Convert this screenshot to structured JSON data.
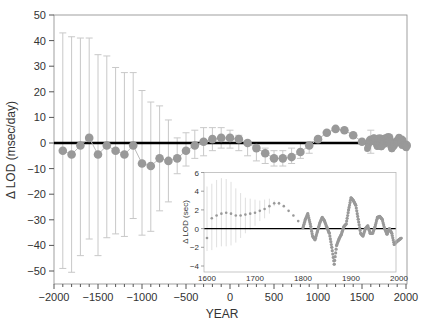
{
  "chart_data": [
    {
      "type": "scatter",
      "title": "",
      "xlabel": "YEAR",
      "ylabel": "Δ LOD (msec/day)",
      "xlim": [
        -2000,
        2000
      ],
      "ylim": [
        -55,
        50
      ],
      "xticks": [
        -2000,
        -1500,
        -1000,
        -500,
        0,
        500,
        1000,
        1500,
        2000
      ],
      "xtick_labels": [
        "−2000",
        "−1500",
        "−1000",
        "−500",
        "0",
        "500",
        "1000",
        "1500",
        "2000"
      ],
      "yticks": [
        50,
        40,
        30,
        20,
        10,
        0,
        -10,
        -20,
        -30,
        -40,
        -50
      ],
      "ytick_labels": [
        "50",
        "40",
        "30",
        "20",
        "10",
        "0",
        "−10",
        "−20",
        "−30",
        "−40",
        "−50"
      ],
      "grid": false,
      "reference_line": 0,
      "series": [
        {
          "name": "LOD change with error bars",
          "x": [
            -1900,
            -1800,
            -1700,
            -1600,
            -1500,
            -1400,
            -1300,
            -1200,
            -1100,
            -1000,
            -900,
            -800,
            -700,
            -600,
            -500,
            -400,
            -300,
            -200,
            -100,
            0,
            100,
            200,
            300,
            400,
            500,
            600,
            700,
            800,
            900,
            1000,
            1100,
            1200,
            1300,
            1400,
            1500,
            1600,
            1700,
            1750,
            1800,
            1850,
            1900,
            1950,
            2000
          ],
          "y": [
            -3,
            -4.5,
            -1,
            2,
            -4.5,
            -1,
            -3,
            -4.5,
            -1,
            -8,
            -9,
            -6,
            -7,
            -6,
            -3,
            -1,
            0.5,
            1.5,
            2,
            2,
            1.5,
            0,
            -2,
            -4,
            -6,
            -6,
            -5.5,
            -3.5,
            -1,
            1.5,
            4,
            5.5,
            5,
            3,
            0.5,
            1,
            1.5,
            0,
            2,
            -1,
            0.5,
            1,
            -1
          ],
          "err_upper": [
            43,
            41.5,
            41,
            41,
            34.5,
            34,
            29.5,
            27.5,
            27.5,
            20.5,
            16,
            14.5,
            9,
            2,
            4,
            5,
            6,
            6,
            6,
            5,
            3,
            1,
            -1,
            -2,
            -3,
            -3,
            -2,
            0,
            0,
            0,
            0,
            0,
            0,
            0,
            0,
            5,
            0,
            0,
            0,
            0,
            0,
            0,
            0
          ],
          "err_lower": [
            -49,
            -50.5,
            -44,
            -37.5,
            -44,
            -37,
            -35.5,
            -36.5,
            -29.5,
            -36,
            -34.5,
            -26.5,
            -23,
            -12,
            -9,
            -6,
            -5,
            -3,
            -2,
            -2,
            -3,
            -5,
            -7,
            -8,
            -9,
            -9,
            -8,
            -6,
            -4,
            0,
            0,
            0,
            0,
            0,
            0,
            -4,
            0,
            0,
            0,
            0,
            0,
            0,
            0
          ]
        }
      ]
    },
    {
      "type": "scatter",
      "title": "",
      "xlabel": "",
      "ylabel": "Δ LOD (sec)",
      "xlim": [
        1595,
        2005
      ],
      "ylim": [
        -4.6,
        6
      ],
      "xticks": [
        1600,
        1700,
        1800,
        1900,
        2000
      ],
      "xtick_labels": [
        "1600",
        "1700",
        "1800",
        "1900",
        "2000"
      ],
      "yticks": [
        6,
        4,
        2,
        0,
        -2,
        -4
      ],
      "ytick_labels": [
        "6",
        "4",
        "2",
        "0",
        "−2",
        "−4"
      ],
      "grid": false,
      "reference_line": 0,
      "series": [
        {
          "name": "Inset LOD (sec)",
          "x": [
            1600,
            1610,
            1620,
            1630,
            1640,
            1650,
            1660,
            1670,
            1680,
            1690,
            1700,
            1710,
            1720,
            1730,
            1740,
            1750,
            1760,
            1770,
            1780,
            1790,
            1800,
            1805,
            1810,
            1815,
            1820,
            1825,
            1830,
            1835,
            1840,
            1845,
            1850,
            1855,
            1860,
            1865,
            1870,
            1875,
            1880,
            1885,
            1890,
            1895,
            1900,
            1905,
            1910,
            1915,
            1920,
            1925,
            1930,
            1935,
            1940,
            1945,
            1950,
            1955,
            1960,
            1965,
            1970,
            1975,
            1980,
            1985,
            1990,
            1995,
            2000,
            2005
          ],
          "y": [
            -1,
            1.1,
            1.4,
            1.6,
            1.7,
            1.6,
            1.4,
            1.4,
            1.5,
            1.6,
            1.7,
            1.9,
            2.1,
            2.4,
            2.7,
            2.7,
            2.4,
            1.9,
            1.4,
            0.8,
            0.1,
            1.0,
            1.6,
            0.5,
            -0.8,
            -1.2,
            -0.3,
            0.6,
            1.2,
            0.8,
            0.1,
            -0.5,
            -2.0,
            -3.8,
            -1.8,
            -1.1,
            -0.6,
            0.2,
            0.5,
            2.0,
            3.3,
            3.0,
            2.5,
            1.0,
            -0.5,
            -0.8,
            0.0,
            0.3,
            -0.5,
            -0.5,
            0.2,
            1.2,
            1.3,
            1.0,
            0.0,
            -0.6,
            0.0,
            -0.5,
            -1.7,
            -1.4,
            -1.2,
            -1.0
          ],
          "err_upper": [
            4.5,
            4.8,
            5.2,
            5.4,
            5.3,
            5.0,
            4.3,
            3.8,
            3.3,
            3.2,
            3.1,
            3.0,
            3.1,
            3.2,
            3.0,
            2.9,
            2.5,
            2.0,
            1.5,
            0.9
          ],
          "err_lower": [
            -2.4,
            -2.3,
            -2.0,
            -1.9,
            -1.9,
            -1.8,
            -1.5,
            -1.0,
            -0.5,
            -0.1,
            0.3,
            0.8,
            1.1,
            1.6,
            2.4,
            2.5,
            2.3,
            1.8,
            1.3,
            0.7
          ]
        }
      ]
    }
  ],
  "labels": {
    "main_xlabel": "YEAR",
    "main_ylabel": "Δ LOD (msec/day)",
    "inset_ylabel": "Δ LOD (sec)"
  },
  "colors": {
    "points": "#999999",
    "errorbars": "#c8c8c8",
    "zero_line": "#000000",
    "axes": "#555555",
    "inset_frame": "#b8b8b8"
  }
}
